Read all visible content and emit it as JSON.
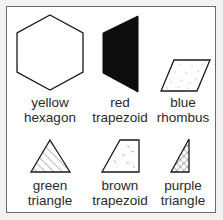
{
  "figure": {
    "items": [
      {
        "color": "yellow",
        "shape": "hexagon",
        "fill": "none"
      },
      {
        "color": "red",
        "shape": "trapezoid",
        "fill": "solid-black"
      },
      {
        "color": "blue",
        "shape": "rhombus",
        "fill": "dotted"
      },
      {
        "color": "green",
        "shape": "triangle",
        "fill": "diagonal-hatch"
      },
      {
        "color": "brown",
        "shape": "trapezoid",
        "fill": "dashed-speckle"
      },
      {
        "color": "purple",
        "shape": "triangle",
        "fill": "crosshatch"
      }
    ],
    "colors": {
      "stroke": "#1a1a1a",
      "frame_border": "#6a6a6a",
      "background": "#ffffff",
      "page_background": "#f2f2f2"
    }
  }
}
